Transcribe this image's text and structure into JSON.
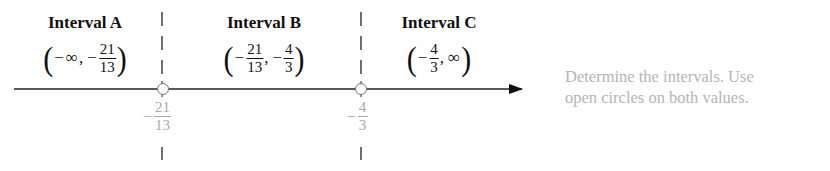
{
  "diagram": {
    "type": "number-line",
    "colors": {
      "axis": "#222222",
      "boundary_label": "#a9a9a9",
      "hint": "#b5b5b5",
      "circle_fill": "#ffffff"
    },
    "intervals": [
      {
        "title": "Interval A",
        "left": {
          "sign": "−",
          "value": "∞"
        },
        "right": {
          "sign": "−",
          "num": "21",
          "den": "13"
        }
      },
      {
        "title": "Interval B",
        "left": {
          "sign": "−",
          "num": "21",
          "den": "13"
        },
        "right": {
          "sign": "−",
          "num": "4",
          "den": "3"
        }
      },
      {
        "title": "Interval C",
        "left": {
          "sign": "−",
          "num": "4",
          "den": "3"
        },
        "right": {
          "sign": "",
          "value": "∞"
        }
      }
    ],
    "boundaries": [
      {
        "sign": "−",
        "num": "21",
        "den": "13",
        "circle": "open"
      },
      {
        "sign": "−",
        "num": "4",
        "den": "3",
        "circle": "open"
      }
    ],
    "punct": {
      "open": "(",
      "close": ")",
      "comma": ","
    },
    "hint_lines": [
      "Determine the intervals. Use",
      "open circles on both values."
    ]
  }
}
